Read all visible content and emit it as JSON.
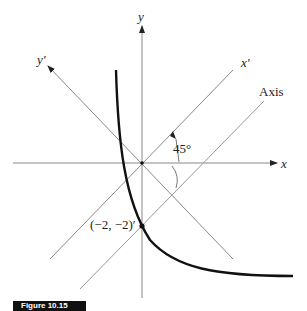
{
  "diagram": {
    "labels": {
      "y_axis": "y",
      "x_axis": "x",
      "y_prime_axis": "y′",
      "x_prime_axis": "x′",
      "axis_line": "Axis",
      "angle": "45°",
      "point": "(−2, −2)′"
    },
    "caption": "Figure 10.15",
    "colors": {
      "axes": "#888888",
      "curve": "#111111",
      "text": "#222222",
      "caption_bg": "#111111"
    },
    "geometry": {
      "origin": [
        142,
        163
      ],
      "rotation_deg": 45,
      "point_coords": [
        -2,
        -2
      ]
    }
  }
}
